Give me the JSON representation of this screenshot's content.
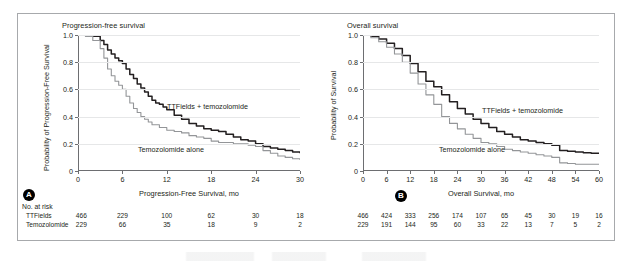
{
  "figure": {
    "panels": [
      {
        "badge": "A",
        "title": "Progression-free survival",
        "ylabel": "Probability of Progression-Free Survival",
        "xlabel": "Progression-Free Survival, mo",
        "curve_labels": {
          "treatment": "TTFields + temozolomide",
          "control": "Temozolomide alone"
        },
        "risk_title": "No. at risk",
        "risk_rows": [
          {
            "name": "TTFields",
            "values": [
              "466",
              "229",
              "100",
              "62",
              "30",
              "18"
            ]
          },
          {
            "name": "Temozolomide",
            "values": [
              "229",
              "66",
              "35",
              "18",
              "9",
              "2"
            ]
          }
        ]
      },
      {
        "badge": "B",
        "title": "Overall survival",
        "ylabel": "Probability of Survival",
        "xlabel": "Overall Survival, mo",
        "curve_labels": {
          "treatment": "TTFields + temozolomide",
          "control": "Temozolomide alone"
        },
        "risk_title": "",
        "risk_rows": [
          {
            "name": "",
            "values": [
              "466",
              "424",
              "333",
              "256",
              "174",
              "107",
              "65",
              "45",
              "30",
              "19",
              "16"
            ]
          },
          {
            "name": "",
            "values": [
              "229",
              "191",
              "144",
              "95",
              "60",
              "33",
              "22",
              "13",
              "7",
              "5",
              "2"
            ]
          }
        ]
      }
    ]
  },
  "chart_data": [
    {
      "type": "line",
      "title": "Progression-free survival",
      "xlabel": "Progression-Free Survival, mo",
      "ylabel": "Probability of Progression-Free Survival",
      "xlim": [
        0,
        30
      ],
      "ylim": [
        0,
        1.0
      ],
      "xticks": [
        0,
        6,
        12,
        18,
        24,
        30
      ],
      "yticks": [
        0,
        0.2,
        0.4,
        0.6,
        0.8,
        1.0
      ],
      "grid": "horizontal",
      "legend": "inline-labels",
      "colors": {
        "treatment": "#231f20",
        "control": "#939598"
      },
      "series": [
        {
          "name": "TTFields + temozolomide",
          "x": [
            0,
            1,
            2,
            3,
            3.5,
            4,
            4.5,
            5,
            5.5,
            6,
            6.5,
            7,
            7.5,
            8,
            8.5,
            9,
            9.5,
            10,
            10.5,
            11,
            11.5,
            12,
            13,
            14,
            15,
            16,
            17,
            18,
            19,
            20,
            21,
            22,
            23,
            24,
            25,
            26,
            27,
            28,
            29,
            30
          ],
          "y": [
            1.0,
            1.0,
            0.99,
            0.96,
            0.93,
            0.89,
            0.86,
            0.83,
            0.81,
            0.79,
            0.75,
            0.71,
            0.68,
            0.64,
            0.61,
            0.58,
            0.55,
            0.52,
            0.5,
            0.49,
            0.47,
            0.45,
            0.41,
            0.38,
            0.35,
            0.33,
            0.31,
            0.3,
            0.29,
            0.27,
            0.25,
            0.23,
            0.22,
            0.2,
            0.18,
            0.17,
            0.16,
            0.15,
            0.14,
            0.13
          ]
        },
        {
          "name": "Temozolomide alone",
          "x": [
            0,
            1,
            2,
            3,
            3.5,
            4,
            4.5,
            5,
            5.5,
            6,
            6.5,
            7,
            7.5,
            8,
            8.5,
            9,
            9.5,
            10,
            11,
            12,
            13,
            14,
            15,
            16,
            17,
            18,
            19,
            20,
            21,
            22,
            23,
            24,
            25,
            26,
            27,
            28,
            29,
            30
          ],
          "y": [
            1.0,
            0.99,
            0.96,
            0.9,
            0.83,
            0.75,
            0.7,
            0.66,
            0.63,
            0.6,
            0.55,
            0.5,
            0.46,
            0.43,
            0.4,
            0.38,
            0.36,
            0.34,
            0.32,
            0.3,
            0.29,
            0.28,
            0.26,
            0.25,
            0.24,
            0.22,
            0.21,
            0.21,
            0.2,
            0.2,
            0.19,
            0.18,
            0.15,
            0.13,
            0.11,
            0.1,
            0.09,
            0.08
          ]
        }
      ],
      "risk_table": {
        "title": "No. at risk",
        "times": [
          0,
          6,
          12,
          18,
          24,
          30
        ],
        "rows": [
          {
            "name": "TTFields",
            "values": [
              466,
              229,
              100,
              62,
              30,
              18
            ]
          },
          {
            "name": "Temozolomide",
            "values": [
              229,
              66,
              35,
              18,
              9,
              2
            ]
          }
        ]
      }
    },
    {
      "type": "line",
      "title": "Overall survival",
      "xlabel": "Overall Survival, mo",
      "ylabel": "Probability of Survival",
      "xlim": [
        0,
        60
      ],
      "ylim": [
        0,
        1.0
      ],
      "xticks": [
        0,
        6,
        12,
        18,
        24,
        30,
        36,
        42,
        48,
        54,
        60
      ],
      "yticks": [
        0,
        0.2,
        0.4,
        0.6,
        0.8,
        1.0
      ],
      "grid": "horizontal",
      "legend": "inline-labels",
      "colors": {
        "treatment": "#231f20",
        "control": "#939598"
      },
      "series": [
        {
          "name": "TTFields + temozolomide",
          "x": [
            0,
            2,
            4,
            6,
            8,
            10,
            12,
            14,
            16,
            18,
            20,
            22,
            24,
            26,
            28,
            30,
            32,
            34,
            36,
            38,
            40,
            42,
            44,
            46,
            48,
            50,
            52,
            54,
            56,
            58,
            60
          ],
          "y": [
            1.0,
            0.99,
            0.97,
            0.94,
            0.9,
            0.85,
            0.79,
            0.73,
            0.66,
            0.62,
            0.56,
            0.51,
            0.46,
            0.42,
            0.38,
            0.35,
            0.32,
            0.29,
            0.27,
            0.25,
            0.23,
            0.22,
            0.21,
            0.2,
            0.19,
            0.15,
            0.145,
            0.14,
            0.135,
            0.13,
            0.13
          ]
        },
        {
          "name": "Temozolomide alone",
          "x": [
            0,
            2,
            4,
            6,
            8,
            10,
            12,
            14,
            16,
            18,
            20,
            22,
            24,
            26,
            28,
            30,
            32,
            34,
            36,
            38,
            40,
            42,
            44,
            46,
            48,
            50,
            52,
            54,
            56,
            58,
            60
          ],
          "y": [
            1.0,
            0.98,
            0.95,
            0.91,
            0.86,
            0.8,
            0.72,
            0.64,
            0.56,
            0.49,
            0.4,
            0.35,
            0.31,
            0.27,
            0.24,
            0.21,
            0.2,
            0.18,
            0.16,
            0.15,
            0.14,
            0.13,
            0.12,
            0.11,
            0.1,
            0.06,
            0.055,
            0.05,
            0.05,
            0.05,
            0.05
          ]
        }
      ],
      "risk_table": {
        "title": "",
        "times": [
          0,
          6,
          12,
          18,
          24,
          30,
          36,
          42,
          48,
          54,
          60
        ],
        "rows": [
          {
            "name": "TTFields",
            "values": [
              466,
              424,
              333,
              256,
              174,
              107,
              65,
              45,
              30,
              19,
              16
            ]
          },
          {
            "name": "Temozolomide",
            "values": [
              229,
              191,
              144,
              95,
              60,
              33,
              22,
              13,
              7,
              5,
              2
            ]
          }
        ]
      }
    }
  ]
}
